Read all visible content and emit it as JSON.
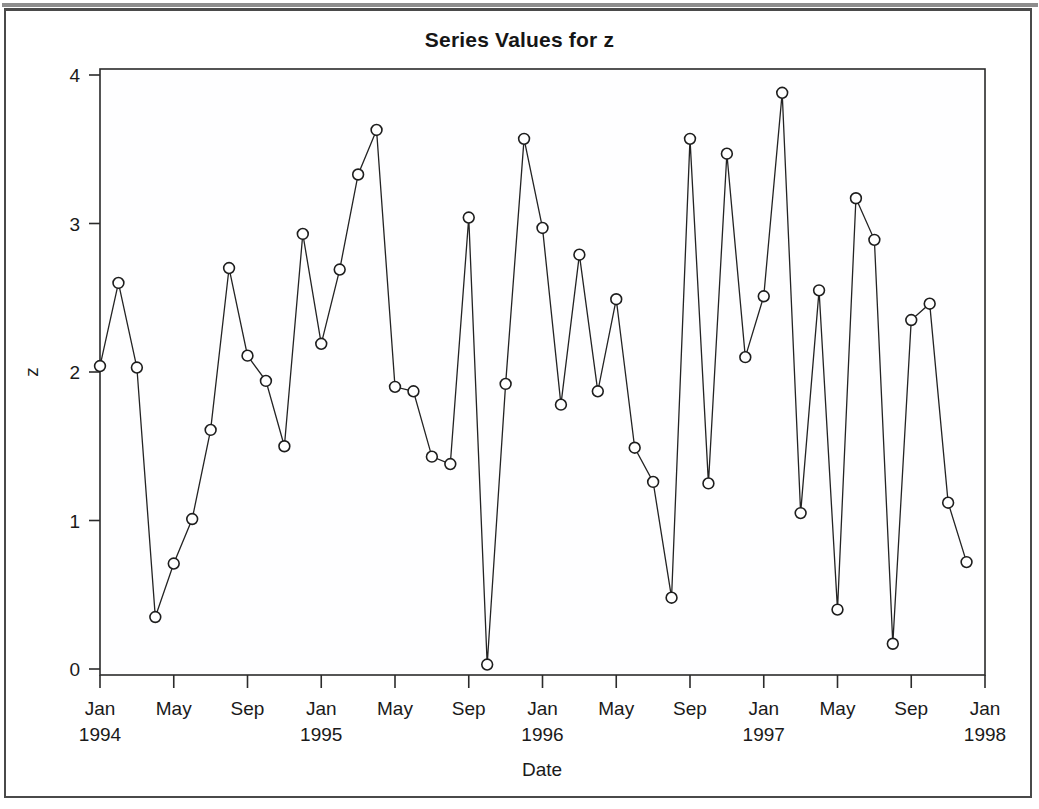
{
  "chart": {
    "title": "Series Values for z",
    "xlabel": "Date",
    "ylabel": "z"
  },
  "chart_data": {
    "type": "line",
    "title": "Series Values for z",
    "xlabel": "Date",
    "ylabel": "z",
    "ylim": [
      0,
      4
    ],
    "yticks": [
      0,
      1,
      2,
      3,
      4
    ],
    "ytick_labels": [
      "0",
      "1",
      "2",
      "3",
      "4"
    ],
    "xlim": [
      "1994-01",
      "1998-01"
    ],
    "xticks": [
      "1994-01",
      "1994-05",
      "1994-09",
      "1995-01",
      "1995-05",
      "1995-09",
      "1996-01",
      "1996-05",
      "1996-09",
      "1997-01",
      "1997-05",
      "1997-09",
      "1998-01"
    ],
    "xtick_labels": [
      {
        "month": "Jan",
        "year": "1994"
      },
      {
        "month": "May",
        "year": ""
      },
      {
        "month": "Sep",
        "year": ""
      },
      {
        "month": "Jan",
        "year": "1995"
      },
      {
        "month": "May",
        "year": ""
      },
      {
        "month": "Sep",
        "year": ""
      },
      {
        "month": "Jan",
        "year": "1996"
      },
      {
        "month": "May",
        "year": ""
      },
      {
        "month": "Sep",
        "year": ""
      },
      {
        "month": "Jan",
        "year": "1997"
      },
      {
        "month": "May",
        "year": ""
      },
      {
        "month": "Sep",
        "year": ""
      },
      {
        "month": "Jan",
        "year": "1998"
      }
    ],
    "grid": true,
    "legend": "none",
    "marker": "open-circle",
    "x": [
      "1994-01",
      "1994-02",
      "1994-03",
      "1994-04",
      "1994-05",
      "1994-06",
      "1994-07",
      "1994-08",
      "1994-09",
      "1994-10",
      "1994-11",
      "1994-12",
      "1995-01",
      "1995-02",
      "1995-03",
      "1995-04",
      "1995-05",
      "1995-06",
      "1995-07",
      "1995-08",
      "1995-09",
      "1995-10",
      "1995-11",
      "1995-12",
      "1996-01",
      "1996-02",
      "1996-03",
      "1996-04",
      "1996-05",
      "1996-06",
      "1996-07",
      "1996-08",
      "1996-09",
      "1996-10",
      "1996-11",
      "1996-12",
      "1997-01",
      "1997-02",
      "1997-03",
      "1997-04",
      "1997-05",
      "1997-06",
      "1997-07",
      "1997-08",
      "1997-09",
      "1997-10",
      "1997-11",
      "1997-12"
    ],
    "series": [
      {
        "name": "z",
        "values": [
          2.04,
          2.6,
          2.03,
          0.35,
          0.71,
          1.01,
          1.61,
          2.7,
          2.11,
          1.94,
          1.5,
          2.93,
          2.19,
          2.69,
          3.33,
          3.63,
          1.9,
          1.87,
          1.43,
          1.38,
          3.04,
          0.03,
          1.92,
          3.57,
          2.97,
          1.78,
          2.79,
          1.87,
          2.49,
          1.49,
          1.26,
          0.48,
          3.57,
          1.25,
          3.47,
          2.1,
          2.51,
          3.88,
          1.05,
          2.55,
          0.4,
          3.17,
          2.89,
          0.17,
          2.35,
          2.46,
          1.12,
          0.72
        ]
      }
    ]
  }
}
